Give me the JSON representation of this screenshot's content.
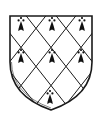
{
  "figure": {
    "pattern": "lozengy",
    "charge": "ermine spot",
    "colors": {
      "field": "#ffffff",
      "line": "#1a1a1a",
      "charge": "#111111"
    },
    "ermine_spots": [
      {
        "x": 21,
        "y": 22
      },
      {
        "x": 52,
        "y": 22
      },
      {
        "x": 82,
        "y": 22
      },
      {
        "x": 21,
        "y": 54
      },
      {
        "x": 52,
        "y": 54
      },
      {
        "x": 82,
        "y": 54
      },
      {
        "x": 50,
        "y": 96
      }
    ]
  }
}
